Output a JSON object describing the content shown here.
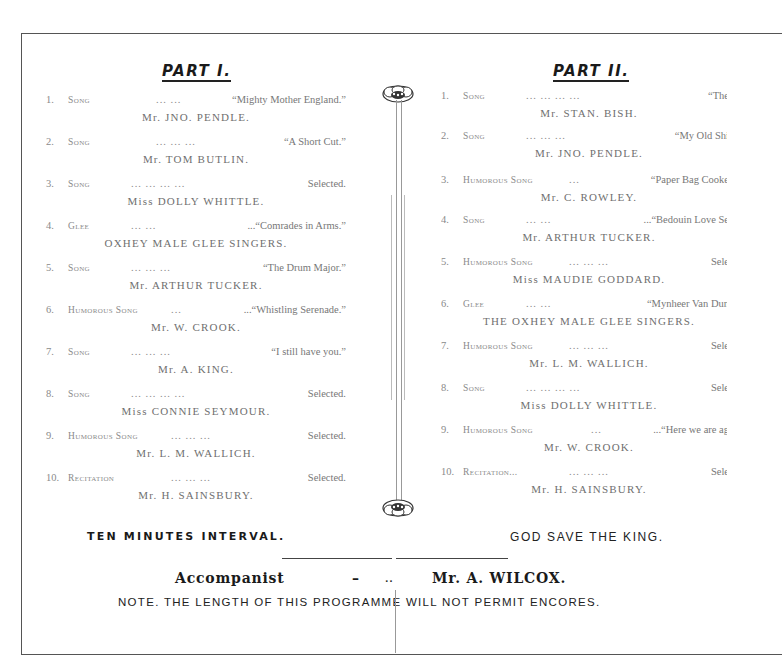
{
  "document": {
    "type": "Concert Programme",
    "accent_color": "#1a1a1a",
    "muted_text_color": "#8a8a8a"
  },
  "part1": {
    "title": "PART I.",
    "items": [
      {
        "num": "1.",
        "kind": "Song",
        "dots": "...        ...",
        "title": "“Mighty Mother England.”",
        "performer": "Mr. JNO. PENDLE."
      },
      {
        "num": "2.",
        "kind": "Song",
        "dots": "...        ...        ...",
        "title": "“A Short Cut.”",
        "performer": "Mr. TOM BUTLIN."
      },
      {
        "num": "3.",
        "kind": "Song",
        "dots": "...        ...        ...        ...",
        "title": "Selected.",
        "performer": "Miss DOLLY WHITTLE."
      },
      {
        "num": "4.",
        "kind": "Glee",
        "dots": "...        ...",
        "title": "...“Comrades in Arms.”",
        "performer": "OXHEY MALE GLEE SINGERS."
      },
      {
        "num": "5.",
        "kind": "Song",
        "dots": "...        ...        ...",
        "title": "“The Drum Major.”",
        "performer": "Mr. ARTHUR TUCKER."
      },
      {
        "num": "6.",
        "kind": "Humorous Song",
        "dots": "...",
        "title": "...“Whistling Serenade.”",
        "performer": "Mr. W. CROOK."
      },
      {
        "num": "7.",
        "kind": "Song",
        "dots": "...        ...        ...",
        "title": "“I still have you.”",
        "performer": "Mr. A. KING."
      },
      {
        "num": "8.",
        "kind": "Song",
        "dots": "...        ...        ...        ...",
        "title": "Selected.",
        "performer": "Miss CONNIE SEYMOUR."
      },
      {
        "num": "9.",
        "kind": "Humorous Song",
        "dots": "...        ...        ...",
        "title": "Selected.",
        "performer": "Mr. L. M. WALLICH."
      },
      {
        "num": "10.",
        "kind": "Recitation",
        "dots": "...        ...        ...",
        "title": "Selected.",
        "performer": "Mr. H. SAINSBURY."
      }
    ],
    "footer": "TEN MINUTES INTERVAL."
  },
  "part2": {
    "title": "PART II.",
    "items": [
      {
        "num": "1.",
        "kind": "Song",
        "dots": "...        ...        ...        ...",
        "title": "“The",
        "performer": "Mr. STAN. BISH."
      },
      {
        "num": "2.",
        "kind": "Song",
        "dots": "...        ...        ...",
        "title": "“My Old Shi",
        "performer": "Mr. JNO. PENDLE."
      },
      {
        "num": "3.",
        "kind": "Humorous Song",
        "dots": "...",
        "title": "“Paper Bag Cooke",
        "performer": "Mr. C. ROWLEY."
      },
      {
        "num": "4.",
        "kind": "Song",
        "dots": "...        ...",
        "title": "...“Bedouin Love Se",
        "performer": "Mr. ARTHUR TUCKER."
      },
      {
        "num": "5.",
        "kind": "Humorous Song",
        "dots": "...        ...        ...",
        "title": "Sele",
        "performer": "Miss MAUDIE GODDARD."
      },
      {
        "num": "6.",
        "kind": "Glee",
        "dots": "...        ...",
        "title": "“Mynheer Van Dun",
        "performer": "THE OXHEY MALE GLEE SINGERS."
      },
      {
        "num": "7.",
        "kind": "Humorous Song",
        "dots": "...        ...        ...",
        "title": "Sele",
        "performer": "Mr. L. M. WALLICH."
      },
      {
        "num": "8.",
        "kind": "Song",
        "dots": "...        ...        ...        ...",
        "title": "Sele",
        "performer": "Miss DOLLY WHITTLE."
      },
      {
        "num": "9.",
        "kind": "Humorous Song",
        "dots": "...",
        "title": "...“Here we are ag",
        "performer": "Mr. W. CROOK."
      },
      {
        "num": "10.",
        "kind": "Recitation...",
        "dots": "...        ...        ...",
        "title": "Sele",
        "performer": "Mr. H. SAINSBURY."
      }
    ],
    "footer": "GOD SAVE THE KING."
  },
  "accompanist": {
    "label": "Accompanist",
    "dash1": "–",
    "dash2": "..",
    "name": "Mr. A. WILCOX."
  },
  "note": "NOTE. THE LENGTH OF THIS PROGRAMME WILL NOT PERMIT ENCORES.",
  "icons": {
    "ornament_top": "flower-ornament-icon",
    "ornament_bottom": "flower-ornament-icon"
  }
}
